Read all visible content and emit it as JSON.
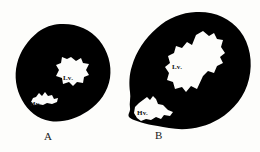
{
  "figure": {
    "background_color": "#fdfdfb",
    "silhouette_color": "#000000",
    "cavity_color": "#ffffff",
    "panels": [
      {
        "id": "A",
        "caption": "A",
        "description": "smaller ovoid black silhouette, apex toward lower-left",
        "labels": [
          {
            "id": "lv",
            "text": "Lv.",
            "meaning": "left ventricle cavity"
          },
          {
            "id": "hv",
            "text": "Hv.",
            "meaning": "right/hepatic vein cavity"
          }
        ]
      },
      {
        "id": "B",
        "caption": "B",
        "description": "larger elongated black silhouette, long axis tilted lower-left to upper-right",
        "labels": [
          {
            "id": "lv",
            "text": "Lv.",
            "meaning": "left ventricle cavity"
          },
          {
            "id": "hv",
            "text": "Hv.",
            "meaning": "right/hepatic vein cavity"
          }
        ]
      }
    ]
  },
  "panel_a": {
    "caption": "A",
    "label_lv": "Lv.",
    "label_hv": "Hv."
  },
  "panel_b": {
    "caption": "B",
    "label_lv": "Lv.",
    "label_hv": "Hv."
  }
}
